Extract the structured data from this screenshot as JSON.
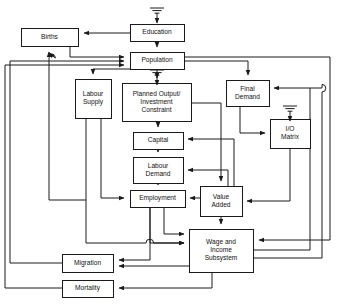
{
  "diagram": {
    "type": "block-flow-diagram",
    "width": 338,
    "height": 306,
    "background_color": "#ffffff",
    "line_color": "#1a1a1a",
    "text_color": "#111111",
    "nodes": [
      {
        "id": "education",
        "label": "Education",
        "lines": [
          "Education"
        ],
        "x": 130,
        "y": 24,
        "w": 54,
        "h": 17
      },
      {
        "id": "births",
        "label": "Births",
        "lines": [
          "Births"
        ],
        "x": 21,
        "y": 28,
        "w": 57,
        "h": 18
      },
      {
        "id": "population",
        "label": "Population",
        "lines": [
          "Population"
        ],
        "x": 130,
        "y": 52,
        "w": 54,
        "h": 17
      },
      {
        "id": "labour_supply",
        "label": "Labour Supply",
        "lines": [
          "Labour",
          "Supply"
        ],
        "x": 75,
        "y": 79,
        "w": 36,
        "h": 39
      },
      {
        "id": "planned_output",
        "label": "Planned Output/ Investment Constraint",
        "lines": [
          "Planned Output/",
          "Investment",
          "Constraint"
        ],
        "x": 122,
        "y": 83,
        "w": 69,
        "h": 38
      },
      {
        "id": "final_demand",
        "label": "Final Demand",
        "lines": [
          "Final",
          "Demand"
        ],
        "x": 226,
        "y": 80,
        "w": 43,
        "h": 26
      },
      {
        "id": "io_matrix",
        "label": "I/O Matrix",
        "lines": [
          "I/O",
          "Matrix"
        ],
        "x": 270,
        "y": 119,
        "w": 40,
        "h": 29
      },
      {
        "id": "capital",
        "label": "Capital",
        "lines": [
          "Capital"
        ],
        "x": 133,
        "y": 132,
        "w": 50,
        "h": 17
      },
      {
        "id": "labour_demand",
        "label": "Labour Demand",
        "lines": [
          "Labour",
          "Demand"
        ],
        "x": 133,
        "y": 157,
        "w": 50,
        "h": 26
      },
      {
        "id": "employment",
        "label": "Employment",
        "lines": [
          "Employment"
        ],
        "x": 130,
        "y": 190,
        "w": 55,
        "h": 17
      },
      {
        "id": "value_added",
        "label": "Value Added",
        "lines": [
          "Value",
          "Added"
        ],
        "x": 200,
        "y": 186,
        "w": 42,
        "h": 30
      },
      {
        "id": "wage_income",
        "label": "Wage and Income Subsystem",
        "lines": [
          "Wage and",
          "Income",
          "Subsystem"
        ],
        "x": 189,
        "y": 229,
        "w": 64,
        "h": 43
      },
      {
        "id": "migration",
        "label": "Migration",
        "lines": [
          "Migration"
        ],
        "x": 62,
        "y": 254,
        "w": 51,
        "h": 18
      },
      {
        "id": "mortality",
        "label": "Mortality",
        "lines": [
          "Mortality"
        ],
        "x": 62,
        "y": 280,
        "w": 51,
        "h": 17
      }
    ],
    "ground_symbols": [
      {
        "id": "ground-education",
        "attached_to": "education",
        "x": 157,
        "y": 8
      },
      {
        "id": "ground-planned-output",
        "attached_to": "planned_output",
        "x": 157,
        "y": 70
      },
      {
        "id": "ground-io-matrix",
        "attached_to": "io_matrix",
        "x": 290,
        "y": 106
      }
    ],
    "edges": [
      {
        "id": "education-to-births",
        "from": "education",
        "to": "births"
      },
      {
        "id": "education-to-population",
        "from": "education",
        "to": "population"
      },
      {
        "id": "births-to-population",
        "from": "births",
        "to": "population"
      },
      {
        "id": "population-to-labour-supply",
        "from": "population",
        "to": "labour_supply"
      },
      {
        "id": "population-to-planned-output",
        "from": "population",
        "to": "planned_output"
      },
      {
        "id": "population-to-final-demand",
        "from": "population",
        "to": "final_demand"
      },
      {
        "id": "population-to-outer-right",
        "from": "population",
        "to": "wage_income"
      },
      {
        "id": "labour-supply-to-employment",
        "from": "labour_supply",
        "to": "employment"
      },
      {
        "id": "labour-supply-to-births",
        "from": "labour_supply",
        "to": "births"
      },
      {
        "id": "planned-output-to-capital",
        "from": "planned_output",
        "to": "capital"
      },
      {
        "id": "planned-output-to-value-added",
        "from": "planned_output",
        "to": "value_added"
      },
      {
        "id": "capital-to-labour-demand",
        "from": "capital",
        "to": "labour_demand"
      },
      {
        "id": "labour-demand-to-employment",
        "from": "labour_demand",
        "to": "employment"
      },
      {
        "id": "final-demand-to-io-matrix",
        "from": "final_demand",
        "to": "io_matrix"
      },
      {
        "id": "io-matrix-to-value-added",
        "from": "io_matrix",
        "to": "value_added"
      },
      {
        "id": "value-added-to-employment",
        "from": "value_added",
        "to": "employment"
      },
      {
        "id": "value-added-to-capital",
        "from": "value_added",
        "to": "capital"
      },
      {
        "id": "value-added-to-labour-demand",
        "from": "value_added",
        "to": "labour_demand"
      },
      {
        "id": "value-added-to-wage-income",
        "from": "value_added",
        "to": "wage_income"
      },
      {
        "id": "employment-to-wage-income",
        "from": "employment",
        "to": "wage_income"
      },
      {
        "id": "employment-to-migration",
        "from": "employment",
        "to": "migration"
      },
      {
        "id": "wage-income-to-migration",
        "from": "wage_income",
        "to": "migration"
      },
      {
        "id": "wage-income-to-mortality",
        "from": "wage_income",
        "to": "mortality"
      },
      {
        "id": "wage-income-to-final-demand",
        "from": "wage_income",
        "to": "final_demand"
      },
      {
        "id": "migration-to-population",
        "from": "migration",
        "to": "population"
      },
      {
        "id": "mortality-to-population",
        "from": "mortality",
        "to": "population"
      }
    ]
  }
}
